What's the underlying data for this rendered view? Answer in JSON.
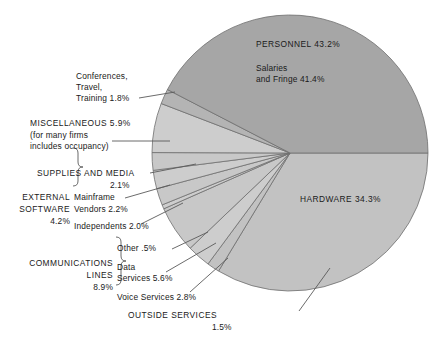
{
  "chart_data": {
    "type": "pie",
    "title": "",
    "legend_position": "callout-labels",
    "units": "percent",
    "total": 100.0,
    "center": {
      "x": 290,
      "y": 153
    },
    "radius": 138,
    "start_angle_deg": 0,
    "direction": "clockwise",
    "categories": [
      "HARDWARE",
      "OUTSIDE SERVICES",
      "Voice Services",
      "Data Services",
      "Other",
      "Independents",
      "Mainframe Vendors",
      "SUPPLIES AND MEDIA",
      "MISCELLANEOUS",
      "Conferences, Travel, Training",
      "PERSONNEL"
    ],
    "values": [
      34.3,
      1.5,
      2.8,
      5.6,
      0.5,
      2.0,
      2.2,
      2.1,
      5.9,
      1.8,
      43.2
    ],
    "slices": [
      {
        "name": "HARDWARE",
        "value": 34.3,
        "color": "#c2c2c2",
        "label_inside": "HARDWARE 34.3%"
      },
      {
        "name": "OUTSIDE SERVICES",
        "value": 1.5,
        "color": "#c2c2c2"
      },
      {
        "name": "Voice Services",
        "value": 2.8,
        "color": "#cdcdcd"
      },
      {
        "name": "Data Services",
        "value": 5.6,
        "color": "#c8c8c8"
      },
      {
        "name": "Other",
        "value": 0.5,
        "color": "#cdcdcd"
      },
      {
        "name": "Independents",
        "value": 2.0,
        "color": "#c8c8c8"
      },
      {
        "name": "Mainframe Vendors",
        "value": 2.2,
        "color": "#cdcdcd"
      },
      {
        "name": "SUPPLIES AND MEDIA",
        "value": 2.1,
        "color": "#c8c8c8"
      },
      {
        "name": "MISCELLANEOUS",
        "value": 5.9,
        "color": "#cdcdcd"
      },
      {
        "name": "Conferences, Travel, Training",
        "value": 1.8,
        "color": "#b4b4b4"
      },
      {
        "name": "PERSONNEL",
        "value": 43.2,
        "color": "#a6a6a6",
        "label_inside": "PERSONNEL 43.2%"
      }
    ],
    "groups": [
      {
        "name": "EXTERNAL SOFTWARE",
        "value": 4.2,
        "members": [
          "Mainframe Vendors",
          "Independents"
        ]
      },
      {
        "name": "COMMUNICATIONS LINES",
        "value": 8.9,
        "members": [
          "Other",
          "Data Services",
          "Voice Services"
        ]
      }
    ],
    "annotations": [
      "PERSONNEL 43.2%",
      "Salaries and Fringe 41.4%",
      "HARDWARE 34.3%"
    ]
  },
  "labels": {
    "personnel_title": "PERSONNEL 43.2%",
    "personnel_sub_line1": "Salaries",
    "personnel_sub_line2": "and Fringe 41.4%",
    "hardware": "HARDWARE 34.3%",
    "conferences_l1": "Conferences,",
    "conferences_l2": "Travel,",
    "conferences_l3": "Training 1.8%",
    "misc_l1": "MISCELLANEOUS 5.9%",
    "misc_l2": "(for many firms",
    "misc_l3": "includes occupancy)",
    "supplies_l1": "SUPPLIES AND MEDIA",
    "supplies_l2": "2.1%",
    "ext_sw_l1": "EXTERNAL",
    "ext_sw_l2": "SOFTWARE",
    "ext_sw_l3": "4.2%",
    "mainframe_l1": "Mainframe",
    "mainframe_l2": "Vendors 2.2%",
    "independents": "Independents 2.0%",
    "comm_l1": "COMMUNICATIONS",
    "comm_l2": "LINES",
    "comm_l3": "8.9%",
    "other": "Other .5%",
    "data_l1": "Data",
    "data_l2": "Services 5.6%",
    "voice": "Voice Services 2.8%",
    "outside_l1": "OUTSIDE SERVICES",
    "outside_l2": "1.5%"
  },
  "colors": {
    "personnel": "#a6a6a6",
    "hardware": "#c2c2c2",
    "light_slice": "#cdcdcd",
    "alt_slice": "#c8c8c8",
    "conferences": "#b4b4b4",
    "stroke": "#6e6e6e",
    "leader": "#5a5a5a",
    "text": "#1a1a1a",
    "background": "#ffffff"
  }
}
